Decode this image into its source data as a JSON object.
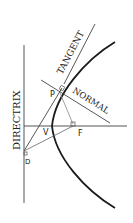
{
  "diagram": {
    "labels": {
      "directrix": "DIRECTRIX",
      "tangent": "TANGENT",
      "normal": "NORMAL",
      "point_p": "P",
      "vertex": "V",
      "focus": "F",
      "point_d": "D"
    },
    "colors": {
      "curve": "#1a1a1a",
      "lines": "#444444",
      "thin": "#888888",
      "background": "#ffffff"
    }
  }
}
